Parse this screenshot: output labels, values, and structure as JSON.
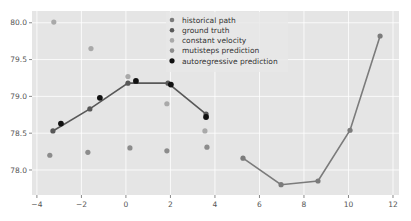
{
  "chart_data": {
    "type": "scatter",
    "title": "",
    "xlabel": "",
    "ylabel": "",
    "xlim": [
      -4.22,
      12.27
    ],
    "ylim": [
      77.66,
      80.16
    ],
    "grid": true,
    "style": "ggplot",
    "legend_position": "top-center",
    "x_ticks": [
      -4,
      -2,
      0,
      2,
      4,
      6,
      8,
      10,
      12
    ],
    "x_tick_labels": [
      "−4",
      "−2",
      "0",
      "2",
      "4",
      "6",
      "8",
      "10",
      "12"
    ],
    "y_ticks": [
      78.0,
      78.5,
      79.0,
      79.5,
      80.0
    ],
    "y_tick_labels": [
      "78.0",
      "78.5",
      "79.0",
      "79.5",
      "80.0"
    ],
    "series": [
      {
        "name": "historical path",
        "color": "#7b7b7b",
        "line": true,
        "points": [
          [
            5.26,
            78.16
          ],
          [
            6.97,
            77.8
          ],
          [
            8.63,
            77.85
          ],
          [
            10.07,
            78.54
          ],
          [
            11.42,
            79.82
          ]
        ]
      },
      {
        "name": "ground truth",
        "color": "#585858",
        "line": true,
        "points": [
          [
            -3.28,
            78.53
          ],
          [
            -1.62,
            78.83
          ],
          [
            0.09,
            79.18
          ],
          [
            1.89,
            79.18
          ],
          [
            3.6,
            78.76
          ]
        ]
      },
      {
        "name": "constant velocity",
        "color": "#a9a9a9",
        "line": false,
        "points": [
          [
            -3.24,
            80.01
          ],
          [
            -1.57,
            79.65
          ],
          [
            0.09,
            79.27
          ],
          [
            1.84,
            78.9
          ],
          [
            3.55,
            78.53
          ]
        ]
      },
      {
        "name": "mutisteps prediction",
        "color": "#8c8c8c",
        "line": false,
        "points": [
          [
            -3.42,
            78.2
          ],
          [
            -1.71,
            78.24
          ],
          [
            0.18,
            78.3
          ],
          [
            1.84,
            78.26
          ],
          [
            3.64,
            78.31
          ]
        ]
      },
      {
        "name": "autoregressive prediction",
        "color": "#111111",
        "line": false,
        "points": [
          [
            -2.92,
            78.63
          ],
          [
            -1.17,
            78.98
          ],
          [
            0.45,
            79.21
          ],
          [
            2.02,
            79.16
          ],
          [
            3.6,
            78.72
          ]
        ]
      }
    ]
  }
}
